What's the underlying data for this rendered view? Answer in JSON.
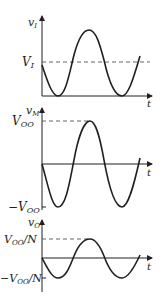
{
  "diagram": {
    "panels": [
      {
        "name": "input",
        "y_label": "v",
        "y_sub": "I",
        "x_label": "t",
        "levels": [
          {
            "label": "V",
            "sub": "I"
          }
        ]
      },
      {
        "name": "mixer",
        "y_label": "v",
        "y_sub": "M",
        "x_label": "t",
        "levels": [
          {
            "label": "V",
            "sub": "OO"
          },
          {
            "label": "−V",
            "sub": "OO"
          }
        ]
      },
      {
        "name": "output",
        "y_label": "v",
        "y_sub": "O",
        "x_label": "t",
        "levels": [
          {
            "label": "V",
            "sub": "OO",
            "suffix": "/N"
          },
          {
            "label": "−V",
            "sub": "OO",
            "suffix": "/N"
          }
        ]
      }
    ],
    "colors": {
      "ink": "#231f20",
      "dash": "#555555"
    }
  }
}
